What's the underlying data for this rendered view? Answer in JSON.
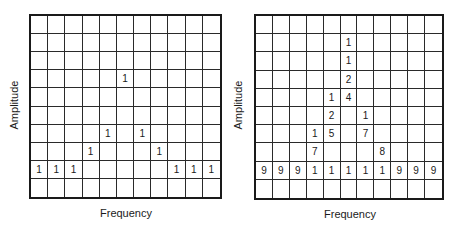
{
  "chart_data": [
    {
      "type": "table",
      "title": "",
      "xlabel": "Frequency",
      "ylabel": "Amplitude",
      "rows": 10,
      "cols": 11,
      "grid": [
        [
          "",
          "",
          "",
          "",
          "",
          "",
          "",
          "",
          "",
          "",
          ""
        ],
        [
          "",
          "",
          "",
          "",
          "",
          "",
          "",
          "",
          "",
          "",
          ""
        ],
        [
          "",
          "",
          "",
          "",
          "",
          "",
          "",
          "",
          "",
          "",
          ""
        ],
        [
          "",
          "",
          "",
          "",
          "",
          "1",
          "",
          "",
          "",
          "",
          ""
        ],
        [
          "",
          "",
          "",
          "",
          "",
          "",
          "",
          "",
          "",
          "",
          ""
        ],
        [
          "",
          "",
          "",
          "",
          "",
          "",
          "",
          "",
          "",
          "",
          ""
        ],
        [
          "",
          "",
          "",
          "",
          "1",
          "",
          "1",
          "",
          "",
          "",
          ""
        ],
        [
          "",
          "",
          "",
          "1",
          "",
          "",
          "",
          "1",
          "",
          "",
          ""
        ],
        [
          "1",
          "1",
          "1",
          "",
          "",
          "",
          "",
          "",
          "1",
          "1",
          "1"
        ],
        [
          "",
          "",
          "",
          "",
          "",
          "",
          "",
          "",
          "",
          "",
          ""
        ]
      ]
    },
    {
      "type": "table",
      "title": "",
      "xlabel": "Frequency",
      "ylabel": "Amplitude",
      "rows": 10,
      "cols": 11,
      "grid": [
        [
          "",
          "",
          "",
          "",
          "",
          "",
          "",
          "",
          "",
          "",
          ""
        ],
        [
          "",
          "",
          "",
          "",
          "",
          "1",
          "",
          "",
          "",
          "",
          ""
        ],
        [
          "",
          "",
          "",
          "",
          "",
          "1",
          "",
          "",
          "",
          "",
          ""
        ],
        [
          "",
          "",
          "",
          "",
          "",
          "2",
          "",
          "",
          "",
          "",
          ""
        ],
        [
          "",
          "",
          "",
          "",
          "1",
          "4",
          "",
          "",
          "",
          "",
          ""
        ],
        [
          "",
          "",
          "",
          "",
          "2",
          "",
          "1",
          "",
          "",
          "",
          ""
        ],
        [
          "",
          "",
          "",
          "1",
          "5",
          "",
          "7",
          "",
          "",
          "",
          ""
        ],
        [
          "",
          "",
          "",
          "7",
          "",
          "",
          "",
          "8",
          "",
          "",
          ""
        ],
        [
          "9",
          "9",
          "9",
          "1",
          "1",
          "1",
          "1",
          "1",
          "9",
          "9",
          "9"
        ],
        [
          "",
          "",
          "",
          "",
          "",
          "",
          "",
          "",
          "",
          "",
          ""
        ]
      ]
    }
  ],
  "panels": [
    {
      "xlabel": "Frequency",
      "ylabel": "Amplitude"
    },
    {
      "xlabel": "Frequency",
      "ylabel": "Amplitude"
    }
  ]
}
